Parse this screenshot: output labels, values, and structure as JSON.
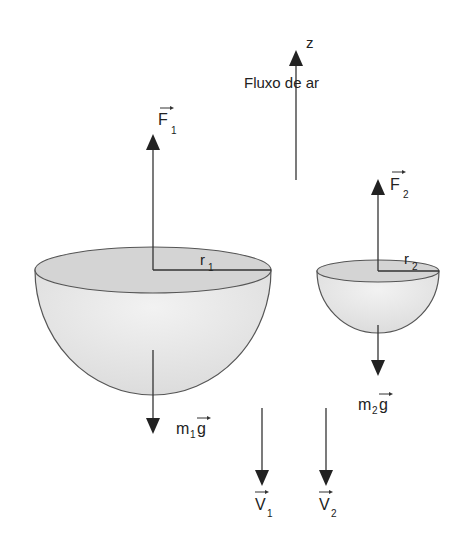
{
  "diagram": {
    "axis": {
      "label": "z",
      "caption": "Fluxo de ar"
    },
    "hemisphere_1": {
      "force_label": "F",
      "force_sub": "1",
      "radius_label": "r",
      "radius_sub": "1",
      "weight_label_m": "m",
      "weight_sub": "1",
      "weight_label_g": "g"
    },
    "hemisphere_2": {
      "force_label": "F",
      "force_sub": "2",
      "radius_label": "r",
      "radius_sub": "2",
      "weight_label_m": "m",
      "weight_sub": "2",
      "weight_label_g": "g"
    },
    "velocities": [
      {
        "label": "V",
        "sub": "1"
      },
      {
        "label": "V",
        "sub": "2"
      }
    ],
    "colors": {
      "line": "#333333",
      "fill_top": "#d6d6d6",
      "fill_body": "#e8e8e8",
      "stroke": "#555555"
    }
  }
}
